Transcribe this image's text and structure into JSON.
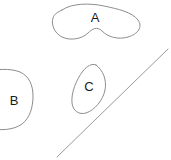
{
  "figure": {
    "background_color": "#ffffff",
    "stroke_color": "#8d8d8d",
    "label_color": "#1a1a1a",
    "width": 171,
    "height": 160
  },
  "regions": [
    {
      "id": "A",
      "label": "A",
      "shape": "kidney-blob",
      "label_x": 95,
      "label_y": 19,
      "path": "M 62 10 C 72 3 90 3 104 6 C 118 9 132 12 138 20 C 143 27 138 34 128 37 C 118 40 108 37 102 31 C 97 26 92 29 88 33 C 82 39 70 41 62 37 C 54 33 51 24 53 18 C 54 14 58 12 62 10 Z"
    },
    {
      "id": "B",
      "label": "B",
      "shape": "rounded-blob-clipped-left",
      "label_x": 14,
      "label_y": 102,
      "path": "M -14 72 C -4 69 10 68 20 72 C 29 76 33 85 33 96 C 33 107 30 118 22 124 C 14 130 0 131 -12 128 C -20 126 -26 120 -28 112 L -28 86 C -26 79 -21 74 -14 72 Z"
    },
    {
      "id": "C",
      "label": "C",
      "shape": "tilted-oval",
      "label_x": 89,
      "label_y": 88,
      "path": "M 96 65 C 103 70 107 80 105 90 C 103 100 95 110 86 113 C 79 115 73 111 72 103 C 71 93 76 80 83 71 C 87 66 92 63 96 65 Z"
    }
  ],
  "divider": {
    "id": "divider-line",
    "label": "diagonal-divider",
    "x1": 57,
    "y1": 157,
    "x2": 168,
    "y2": 49
  }
}
